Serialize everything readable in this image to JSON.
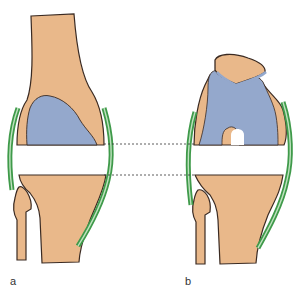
{
  "figure": {
    "panels": [
      {
        "id": "a",
        "label": "a",
        "view": "knee joint, anterior view (extended), with collateral ligaments and joint space gap"
      },
      {
        "id": "b",
        "label": "b",
        "view": "knee joint, flexed view with patella, collateral ligaments and joint space gap"
      }
    ],
    "colors": {
      "bone": "#e9b88a",
      "cartilage": "#94a8cc",
      "ligament": "#3f9a4a",
      "ligament_inner": "#bfe2bf",
      "outline": "#3a2a22",
      "gap": "#ffffff",
      "dashed_line": "#333333"
    },
    "annotations": {
      "dashed_lines": 2,
      "dashed_lines_meaning": "joint gap alignment between panels"
    }
  }
}
